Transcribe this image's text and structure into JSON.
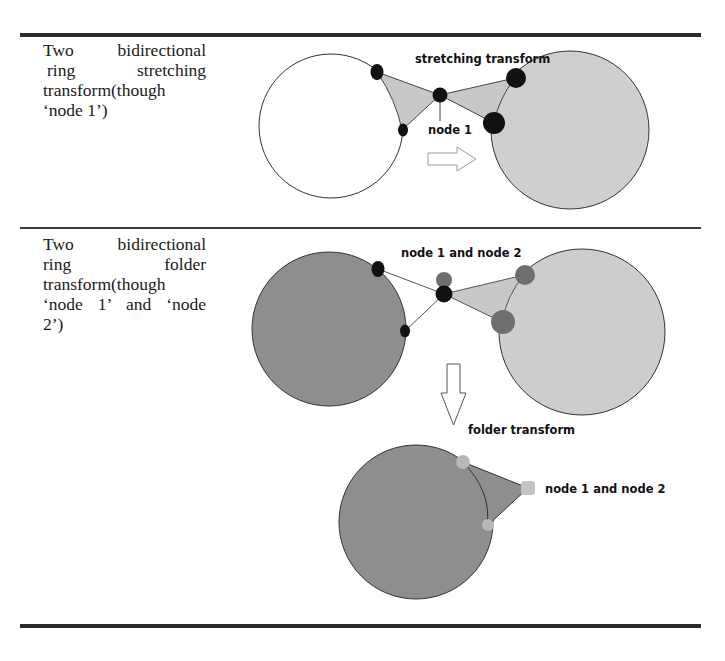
{
  "table": {
    "rows": [
      {
        "description_lines": [
          "Two bidirectional",
          "ring stretching",
          "transform(though",
          "‘node 1’)"
        ],
        "figure": {
          "labels": {
            "transform": "stretching transform",
            "node": "node 1"
          },
          "left_ring": {
            "cx": 331,
            "cy": 126,
            "r": 72,
            "fill": "#ffffff"
          },
          "right_ring": {
            "cx": 570,
            "cy": 130,
            "r": 79,
            "fill": "#cfcfcf"
          },
          "arrow": "right-arrow"
        }
      },
      {
        "description_lines": [
          "Two bidirectional",
          "ring folder",
          "transform(though",
          "‘node 1’ and ‘node",
          "2’)"
        ],
        "figure": {
          "labels": {
            "top_node": "node 1 and node 2",
            "transform": "folder transform",
            "result_node": "node 1 and node 2"
          },
          "left_ring": {
            "cx": 329,
            "cy": 329,
            "r": 77,
            "fill": "#8e8e8e"
          },
          "right_ring": {
            "cx": 582,
            "cy": 332,
            "r": 83,
            "fill": "#cdcdcd"
          },
          "result_ring": {
            "cx": 416,
            "cy": 522,
            "r": 77,
            "fill": "#8e8e8e"
          },
          "arrow": "down-arrow"
        }
      }
    ]
  },
  "colors": {
    "rule": "#2b2b2b",
    "node_black": "#111111",
    "node_grey": "#6b6b6b",
    "node_light": "#bdbdbd",
    "wedge_fill": "#c8c8c8",
    "wedge_dark": "#8e8e8e"
  }
}
